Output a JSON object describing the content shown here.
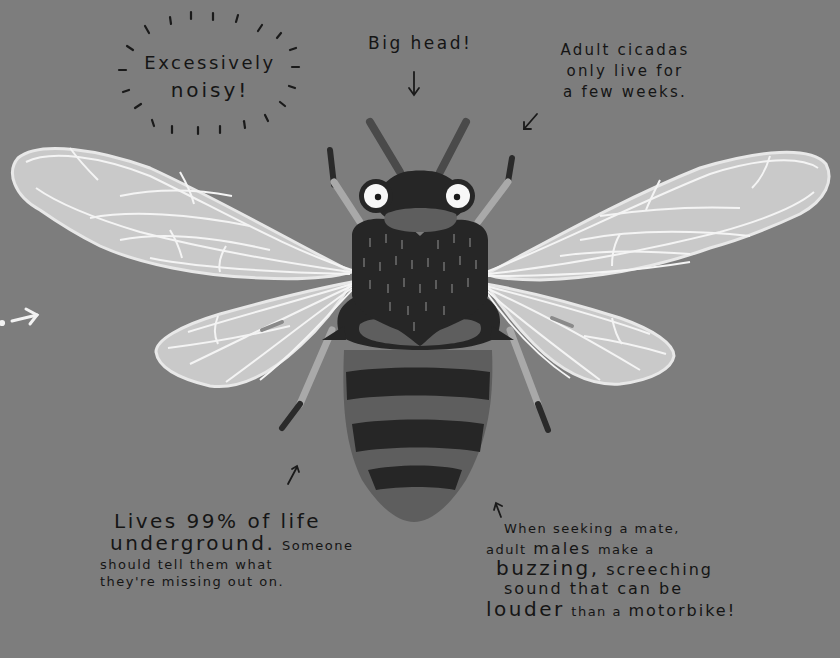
{
  "illustration": {
    "subject": "cicada",
    "background_color": "#7d7d7d",
    "colors": {
      "wing_fill": "#c9c9c9",
      "wing_veins": "#f4f4f4",
      "body_dark": "#262626",
      "body_mid": "#5e5e5e",
      "eye_white": "#f7f7f7",
      "leg_light": "#a9a9a9",
      "text": "#151515",
      "arrow_light": "#f2f2f2"
    }
  },
  "annotations": {
    "noisy": {
      "line1": "Excessively",
      "line2": "noisy!"
    },
    "head": {
      "text": "Big head!"
    },
    "adult": {
      "line1": "Adult cicadas",
      "line2": "only live for",
      "line3": "a few weeks."
    },
    "lives": {
      "line1": "Lives 99% of life",
      "line2a": "underground.",
      "line2b": "Someone",
      "line3": "should tell them what",
      "line4": "they're missing out on."
    },
    "males": {
      "line1": "When seeking a mate,",
      "line2a": "adult",
      "line2b": "males",
      "line2c": "make a",
      "line3a": "buzzing,",
      "line3b": "screeching",
      "line4": "sound that can be",
      "line5a": "louder",
      "line5b": "than a",
      "line5c": "motorbike!"
    }
  }
}
